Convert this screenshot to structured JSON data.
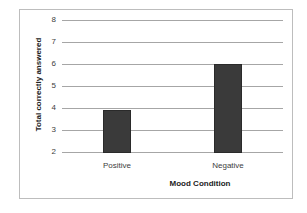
{
  "chart_data": {
    "type": "bar",
    "title": "",
    "xlabel": "Mood Condition",
    "ylabel": "Total correctly answered",
    "categories": [
      "Positive",
      "Negative"
    ],
    "values": [
      3.9,
      6.0
    ],
    "ylim": [
      2,
      8
    ],
    "yticks": [
      "2",
      "3",
      "4",
      "5",
      "6",
      "7",
      "8"
    ],
    "grid": true,
    "legend": "none",
    "bar_color": "#3a3a3a"
  }
}
